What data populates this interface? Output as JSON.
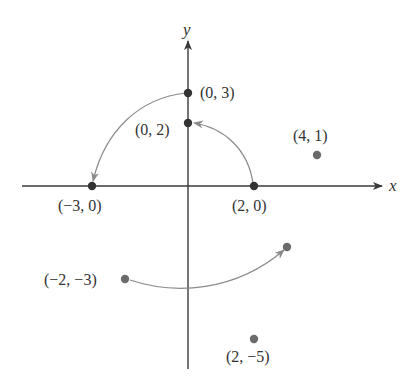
{
  "diagram": {
    "type": "coordinate-plane-rotation",
    "axes": {
      "x_label": "x",
      "y_label": "y"
    },
    "points": [
      {
        "id": "p_0_3",
        "coords": [
          0,
          3
        ],
        "label": "(0, 3)",
        "style": "dark"
      },
      {
        "id": "p_0_2",
        "coords": [
          0,
          2
        ],
        "label": "(0, 2)",
        "style": "dark"
      },
      {
        "id": "p_4_1",
        "coords": [
          4,
          1
        ],
        "label": "(4, 1)",
        "style": "light"
      },
      {
        "id": "p_m3_0",
        "coords": [
          -3,
          0
        ],
        "label": "(−3, 0)",
        "style": "dark"
      },
      {
        "id": "p_2_0",
        "coords": [
          2,
          0
        ],
        "label": "(2, 0)",
        "style": "dark"
      },
      {
        "id": "p_m2_m3",
        "coords": [
          -2,
          -3
        ],
        "label": "(−2, −3)",
        "style": "light"
      },
      {
        "id": "p_2_m5",
        "coords": [
          2,
          -5
        ],
        "label": "(2, −5)",
        "style": "light"
      }
    ],
    "arrows": [
      {
        "from": "(0, 3)",
        "to": "(−3, 0)",
        "kind": "counterclockwise-arc"
      },
      {
        "from": "(2, 0)",
        "to": "(0, 2)",
        "kind": "counterclockwise-arc"
      },
      {
        "from": "(−2, −3)",
        "to": "(3, −2)",
        "kind": "curved-arrow"
      }
    ],
    "colors": {
      "axis": "#3a3a3a",
      "dark_point": "#333333",
      "light_point": "#6b6b6b",
      "arrow": "#8a8a8a",
      "text": "#333333"
    }
  }
}
